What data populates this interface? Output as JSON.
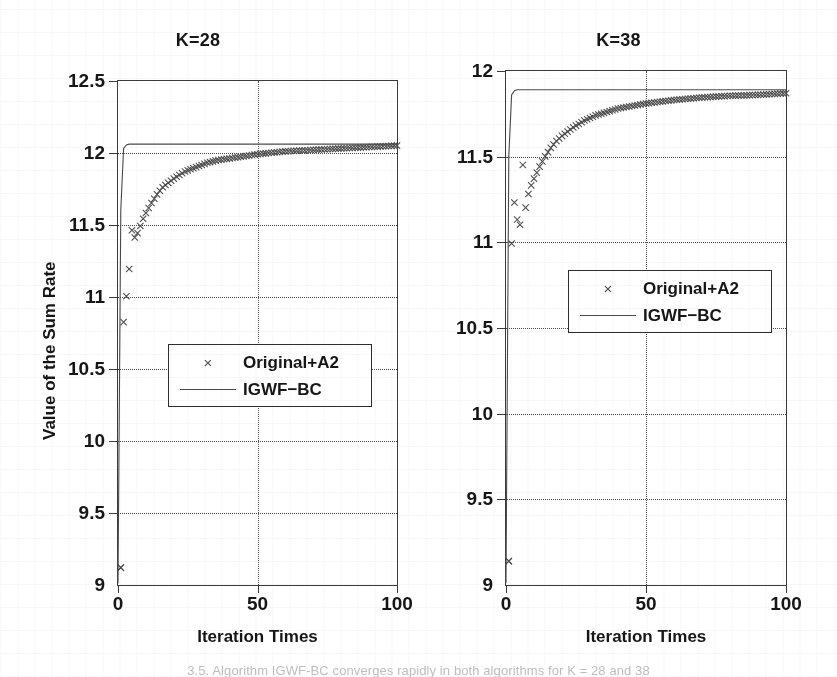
{
  "figure": {
    "caption": "3.5. Algorithm IGWF-BC converges rapidly in both algorithms for K = 28 and 38"
  },
  "chart_data": [
    {
      "type": "line",
      "title": "K=28",
      "xlabel": "Iteration Times",
      "ylabel": "Value of the Sum Rate",
      "xlim": [
        0,
        100
      ],
      "ylim": [
        9,
        12.5
      ],
      "xticks": [
        0,
        50,
        100
      ],
      "yticks": [
        9,
        9.5,
        10,
        10.5,
        11,
        11.5,
        12,
        12.5
      ],
      "xtick_labels": [
        "0",
        "50",
        "100"
      ],
      "ytick_labels": [
        "9",
        "9.5",
        "10",
        "10.5",
        "11",
        "11.5",
        "12",
        "12.5"
      ],
      "grid": true,
      "legend_position": "center-left",
      "series": [
        {
          "name": "Original+A2",
          "marker": "x",
          "style": "markers",
          "color": "#4a4a4a",
          "x": [
            1,
            2,
            3,
            4,
            5,
            6,
            7,
            8,
            9,
            10,
            12,
            14,
            16,
            18,
            20,
            24,
            28,
            32,
            36,
            40,
            50,
            60,
            70,
            80,
            90,
            100
          ],
          "y": [
            9.11,
            10.82,
            11.0,
            11.19,
            11.46,
            11.41,
            11.44,
            11.49,
            11.54,
            11.58,
            11.65,
            11.71,
            11.76,
            11.79,
            11.82,
            11.87,
            11.9,
            11.93,
            11.95,
            11.96,
            11.99,
            12.01,
            12.02,
            12.03,
            12.04,
            12.05
          ]
        },
        {
          "name": "IGWF-BC",
          "marker": "none",
          "style": "line",
          "color": "#4a4a4a",
          "x": [
            0,
            1,
            2,
            3,
            4,
            5,
            6,
            8,
            10,
            20,
            40,
            60,
            80,
            100
          ],
          "y": [
            9.0,
            11.6,
            12.03,
            12.055,
            12.06,
            12.06,
            12.06,
            12.06,
            12.06,
            12.06,
            12.06,
            12.06,
            12.06,
            12.06
          ]
        }
      ]
    },
    {
      "type": "line",
      "title": "K=38",
      "xlabel": "Iteration Times",
      "ylabel": "Value of the Sum Rate",
      "xlim": [
        0,
        100
      ],
      "ylim": [
        9,
        12
      ],
      "xticks": [
        0,
        50,
        100
      ],
      "yticks": [
        9,
        9.5,
        10,
        10.5,
        11,
        11.5,
        12
      ],
      "xtick_labels": [
        "0",
        "50",
        "100"
      ],
      "ytick_labels": [
        "9",
        "9.5",
        "10",
        "10.5",
        "11",
        "11.5",
        "12"
      ],
      "grid": true,
      "legend_position": "center-left",
      "series": [
        {
          "name": "Original+A2",
          "marker": "x",
          "style": "markers",
          "color": "#4a4a4a",
          "x": [
            1,
            2,
            3,
            4,
            5,
            6,
            7,
            8,
            9,
            10,
            12,
            14,
            16,
            18,
            20,
            24,
            28,
            32,
            36,
            40,
            50,
            60,
            70,
            80,
            90,
            100
          ],
          "y": [
            9.13,
            10.99,
            11.23,
            11.13,
            11.1,
            11.45,
            11.2,
            11.28,
            11.33,
            11.37,
            11.44,
            11.5,
            11.55,
            11.59,
            11.62,
            11.67,
            11.71,
            11.74,
            11.76,
            11.78,
            11.81,
            11.83,
            11.845,
            11.855,
            11.86,
            11.87
          ]
        },
        {
          "name": "IGWF-BC",
          "marker": "none",
          "style": "line",
          "color": "#4a4a4a",
          "x": [
            0,
            1,
            2,
            3,
            4,
            5,
            6,
            8,
            10,
            20,
            40,
            60,
            80,
            100
          ],
          "y": [
            9.0,
            11.5,
            11.86,
            11.885,
            11.89,
            11.89,
            11.89,
            11.89,
            11.89,
            11.89,
            11.89,
            11.89,
            11.89,
            11.89
          ]
        }
      ]
    }
  ],
  "legend": {
    "entries": [
      {
        "label": "Original+A2",
        "marker": "x"
      },
      {
        "label": "IGWF−BC",
        "marker": "line"
      }
    ]
  }
}
